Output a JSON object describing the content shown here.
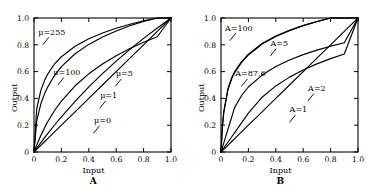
{
  "figure": {
    "x_axis_label": "Input",
    "y_axis_label": "Output",
    "tick_labels": [
      "0",
      "0.2",
      "0.4",
      "0.6",
      "0.8",
      "1.0"
    ],
    "tick_values": [
      0,
      0.2,
      0.4,
      0.6,
      0.8,
      1.0
    ],
    "line_color": "#000000",
    "background_color": "#ffffff"
  },
  "panels": [
    {
      "letter": "A",
      "caption": "A"
    },
    {
      "letter": "B",
      "caption": "B"
    }
  ],
  "chart_data": [
    {
      "type": "line",
      "panel": "A",
      "title": "A",
      "xlabel": "Input",
      "ylabel": "Output",
      "xlim": [
        0,
        1
      ],
      "ylim": [
        0,
        1
      ],
      "xticks": [
        0,
        0.2,
        0.4,
        0.6,
        0.8,
        1.0
      ],
      "yticks": [
        0,
        0.2,
        0.4,
        0.6,
        0.8,
        1.0
      ],
      "xticklabels": [
        "0",
        "0.2",
        "0.4",
        "0.6",
        "0.8",
        "1.0"
      ],
      "yticklabels": [
        "0",
        "0.2",
        "0.4",
        "0.6",
        "0.8",
        "1.0"
      ],
      "grid": false,
      "legend": "annotations",
      "x": [
        0,
        0.02,
        0.05,
        0.08,
        0.1,
        0.15,
        0.2,
        0.3,
        0.4,
        0.5,
        0.6,
        0.7,
        0.8,
        0.9,
        1.0
      ],
      "series": [
        {
          "name": "μ=255",
          "label": "μ=255",
          "values": [
            0,
            0.324,
            0.46,
            0.542,
            0.581,
            0.657,
            0.711,
            0.789,
            0.845,
            0.888,
            0.923,
            0.953,
            0.979,
            1.0,
            1.0
          ]
        },
        {
          "name": "μ=100",
          "label": "μ=100",
          "values": [
            0,
            0.232,
            0.36,
            0.443,
            0.485,
            0.572,
            0.637,
            0.733,
            0.803,
            0.858,
            0.903,
            0.942,
            0.975,
            1.0,
            1.0
          ]
        },
        {
          "name": "μ=5",
          "label": "μ=5",
          "values": [
            0,
            0.0523,
            0.1236,
            0.1874,
            0.2254,
            0.3095,
            0.3802,
            0.494,
            0.5834,
            0.6566,
            0.7184,
            0.7717,
            0.8185,
            0.8601,
            1.0
          ]
        },
        {
          "name": "μ=1",
          "label": "μ=1",
          "values": [
            0,
            0.0286,
            0.0704,
            0.111,
            0.1375,
            0.2016,
            0.263,
            0.3785,
            0.4854,
            0.585,
            0.6781,
            0.7655,
            0.848,
            0.926,
            1.0
          ]
        },
        {
          "name": "μ=0",
          "label": "μ=0",
          "values": [
            0,
            0.02,
            0.05,
            0.08,
            0.1,
            0.15,
            0.2,
            0.3,
            0.4,
            0.5,
            0.6,
            0.7,
            0.8,
            0.9,
            1.0
          ]
        }
      ],
      "annotations": [
        {
          "text": "μ=255",
          "x": 0.13,
          "y": 0.875
        },
        {
          "text": "μ=100",
          "x": 0.24,
          "y": 0.575
        },
        {
          "text": "μ=5",
          "x": 0.66,
          "y": 0.565
        },
        {
          "text": "μ=1",
          "x": 0.545,
          "y": 0.4
        },
        {
          "text": "μ=0",
          "x": 0.5,
          "y": 0.215
        }
      ]
    },
    {
      "type": "line",
      "panel": "B",
      "title": "B",
      "xlabel": "Input",
      "ylabel": "Output",
      "xlim": [
        0,
        1
      ],
      "ylim": [
        0,
        1
      ],
      "xticks": [
        0,
        0.2,
        0.4,
        0.6,
        0.8,
        1.0
      ],
      "yticks": [
        0,
        0.2,
        0.4,
        0.6,
        0.8,
        1.0
      ],
      "xticklabels": [
        "0",
        "0.2",
        "0.4",
        "0.6",
        "0.8",
        "1.0"
      ],
      "yticklabels": [
        "0",
        "0.2",
        "0.4",
        "0.6",
        "0.8",
        "1.0"
      ],
      "grid": false,
      "legend": "annotations",
      "x": [
        0,
        0.01,
        0.02,
        0.05,
        0.08,
        0.1,
        0.15,
        0.2,
        0.3,
        0.4,
        0.5,
        0.6,
        0.7,
        0.8,
        0.9,
        1.0
      ],
      "series": [
        {
          "name": "A=100",
          "label": "A=100",
          "values": [
            0,
            0.19,
            0.3,
            0.47,
            0.56,
            0.6,
            0.675,
            0.73,
            0.81,
            0.865,
            0.908,
            0.944,
            0.974,
            1.0,
            1.0,
            1.0
          ]
        },
        {
          "name": "A=87.6",
          "label": "A=87.6",
          "values": [
            0,
            0.183,
            0.292,
            0.462,
            0.552,
            0.592,
            0.669,
            0.724,
            0.806,
            0.862,
            0.906,
            0.943,
            0.973,
            1.0,
            1.0,
            1.0
          ]
        },
        {
          "name": "A=5",
          "label": "A=5",
          "values": [
            0,
            0.0333,
            0.0667,
            0.1667,
            0.2667,
            0.3333,
            0.4217,
            0.485,
            0.5741,
            0.6374,
            0.6864,
            0.7265,
            0.7604,
            0.7897,
            0.8157,
            1.0
          ]
        },
        {
          "name": "A=2",
          "label": "A=2",
          "values": [
            0,
            0.0145,
            0.029,
            0.0725,
            0.1159,
            0.1449,
            0.2174,
            0.2899,
            0.4088,
            0.4933,
            0.5588,
            0.6123,
            0.6576,
            0.6968,
            0.7314,
            1.0
          ]
        },
        {
          "name": "A=1",
          "label": "A=1",
          "values": [
            0,
            0.01,
            0.02,
            0.05,
            0.08,
            0.1,
            0.15,
            0.2,
            0.3,
            0.4,
            0.5,
            0.6,
            0.7,
            0.8,
            0.9,
            1.0
          ]
        }
      ],
      "annotations": [
        {
          "text": "A=100",
          "x": 0.13,
          "y": 0.905
        },
        {
          "text": "A=5",
          "x": 0.425,
          "y": 0.79
        },
        {
          "text": "A=87.6",
          "x": 0.215,
          "y": 0.565
        },
        {
          "text": "A=2",
          "x": 0.7,
          "y": 0.455
        },
        {
          "text": "A=1",
          "x": 0.565,
          "y": 0.295
        }
      ]
    }
  ]
}
